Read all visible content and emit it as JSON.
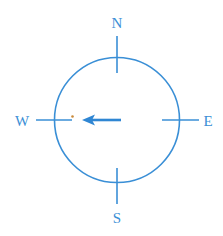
{
  "diagram": {
    "type": "compass",
    "colors": {
      "line": "#3a8fd6",
      "arrow": "#2f86d3",
      "dot": "#c98a3a",
      "background": "#ffffff"
    },
    "labels": {
      "north": "N",
      "south": "S",
      "east": "E",
      "west": "W"
    },
    "arrow": {
      "direction": "west"
    }
  }
}
